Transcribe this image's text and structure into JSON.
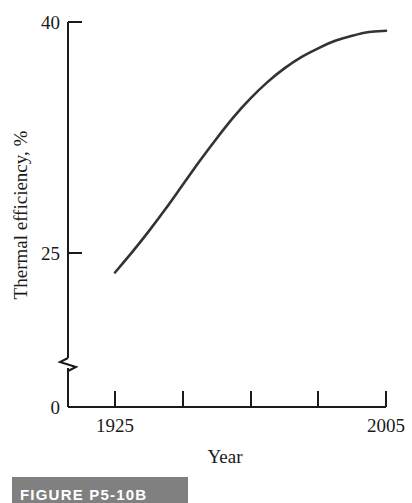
{
  "figure": {
    "caption": "FIGURE P5-10B",
    "caption_bar_color": "#808080",
    "caption_text_color": "#ffffff"
  },
  "chart_data": {
    "type": "line",
    "title": "",
    "subtitle": "",
    "xlabel": "Year",
    "ylabel": "Thermal efficiency, %",
    "line_color": "#333333",
    "axis_color": "#1a1a1a",
    "grid": false,
    "legend": false,
    "legend_position": "none",
    "xlim": [
      1925,
      2005
    ],
    "ylim": [
      0,
      40
    ],
    "y_axis_break": true,
    "y_axis_break_between": [
      0,
      19
    ],
    "xticks": [
      1925,
      1945,
      1965,
      1985,
      2005
    ],
    "xtick_labels": [
      "1925",
      "",
      "",
      "",
      "2005"
    ],
    "yticks": [
      0,
      25,
      40
    ],
    "ytick_labels": [
      "0",
      "25",
      "40"
    ],
    "series": [
      {
        "name": "Thermal efficiency",
        "x": [
          1925,
          1930,
          1935,
          1940,
          1945,
          1950,
          1955,
          1960,
          1965,
          1970,
          1975,
          1980,
          1985,
          1990,
          1995,
          2000,
          2005
        ],
        "values": [
          20.0,
          21.6,
          23.3,
          25.1,
          27.0,
          28.9,
          30.7,
          32.4,
          33.9,
          35.2,
          36.3,
          37.2,
          37.9,
          38.5,
          38.9,
          39.2,
          39.3
        ]
      }
    ]
  },
  "axis_labels": {
    "y_top": "40",
    "y_mid": "25",
    "y_zero": "0",
    "x_first": "1925",
    "x_last": "2005",
    "x_title": "Year",
    "y_title": "Thermal efficiency, %"
  }
}
